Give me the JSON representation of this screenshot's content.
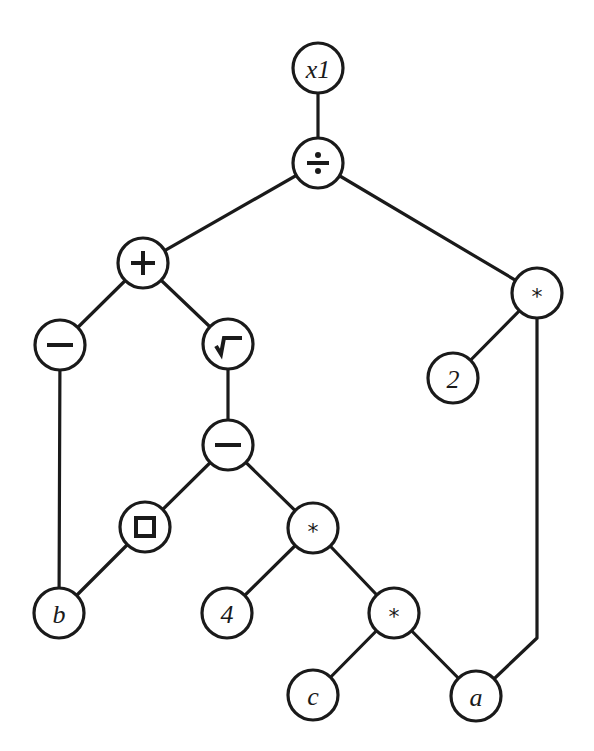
{
  "diagram": {
    "type": "expression-tree",
    "node_radius": 25,
    "stroke_color": "#1a1a1a",
    "background": "#ffffff",
    "nodes": [
      {
        "id": "x1",
        "label": "x1",
        "kind": "variable",
        "x": 318,
        "y": 68
      },
      {
        "id": "div",
        "label": "÷",
        "kind": "divide",
        "x": 318,
        "y": 163
      },
      {
        "id": "plus",
        "label": "+",
        "kind": "plus",
        "x": 143,
        "y": 263
      },
      {
        "id": "mulR",
        "label": "*",
        "kind": "multiply",
        "x": 537,
        "y": 293
      },
      {
        "id": "minL",
        "label": "−",
        "kind": "minus",
        "x": 60,
        "y": 345
      },
      {
        "id": "sqrt",
        "label": "√",
        "kind": "sqrt",
        "x": 228,
        "y": 344
      },
      {
        "id": "two",
        "label": "2",
        "kind": "constant",
        "x": 453,
        "y": 378
      },
      {
        "id": "minM",
        "label": "−",
        "kind": "minus",
        "x": 228,
        "y": 445
      },
      {
        "id": "sq",
        "label": "□",
        "kind": "square",
        "x": 145,
        "y": 527
      },
      {
        "id": "mulM",
        "label": "*",
        "kind": "multiply",
        "x": 313,
        "y": 528
      },
      {
        "id": "b",
        "label": "b",
        "kind": "variable",
        "x": 59,
        "y": 613
      },
      {
        "id": "four",
        "label": "4",
        "kind": "constant",
        "x": 227,
        "y": 613
      },
      {
        "id": "mulL",
        "label": "*",
        "kind": "multiply",
        "x": 394,
        "y": 613
      },
      {
        "id": "c",
        "label": "c",
        "kind": "variable",
        "x": 313,
        "y": 695
      },
      {
        "id": "a",
        "label": "a",
        "kind": "variable",
        "x": 476,
        "y": 696
      }
    ],
    "edges": [
      {
        "from": "x1",
        "to": "div"
      },
      {
        "from": "div",
        "to": "plus"
      },
      {
        "from": "div",
        "to": "mulR"
      },
      {
        "from": "plus",
        "to": "minL"
      },
      {
        "from": "plus",
        "to": "sqrt"
      },
      {
        "from": "mulR",
        "to": "two"
      },
      {
        "from": "mulR",
        "to": "a",
        "via": [
          [
            537,
            638
          ]
        ]
      },
      {
        "from": "minL",
        "to": "b"
      },
      {
        "from": "sqrt",
        "to": "minM"
      },
      {
        "from": "minM",
        "to": "sq"
      },
      {
        "from": "minM",
        "to": "mulM"
      },
      {
        "from": "sq",
        "to": "b"
      },
      {
        "from": "mulM",
        "to": "four"
      },
      {
        "from": "mulM",
        "to": "mulL"
      },
      {
        "from": "mulL",
        "to": "c"
      },
      {
        "from": "mulL",
        "to": "a"
      }
    ]
  }
}
